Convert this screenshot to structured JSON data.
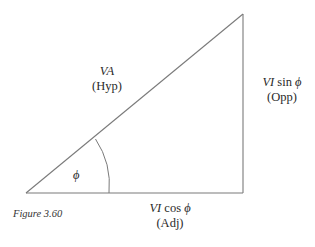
{
  "figure": {
    "caption": "Figure 3.60",
    "angle_symbol": "ϕ",
    "hypotenuse": {
      "quantity": "VA",
      "name": "(Hyp)"
    },
    "opposite": {
      "quantity_italic": "VI",
      "quantity_rest": " sin ",
      "symbol": "ϕ",
      "name": "(Opp)"
    },
    "adjacent": {
      "quantity_italic": "VI",
      "quantity_rest": " cos ",
      "symbol": "ϕ",
      "name": "(Adj)"
    },
    "colors": {
      "stroke": "#7a7a7a",
      "text": "#2a2a2a"
    }
  }
}
